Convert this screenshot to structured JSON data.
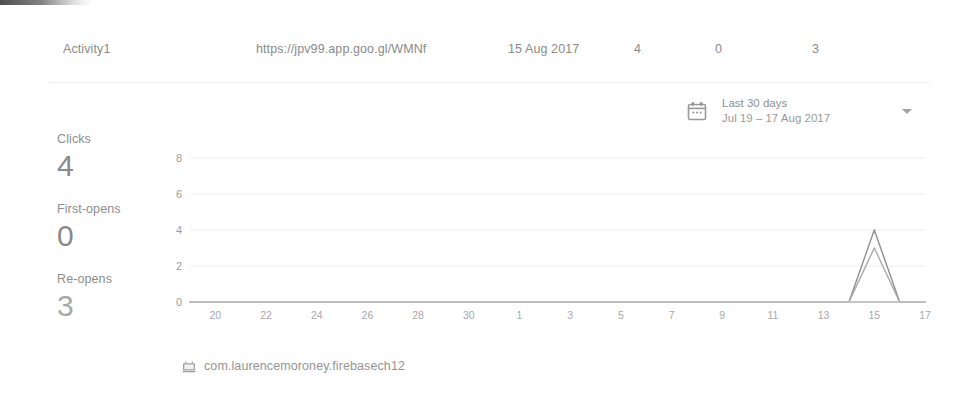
{
  "link_row": {
    "name": "Activity1",
    "url": "https://jpv99.app.goo.gl/WMNf",
    "date": "15 Aug 2017",
    "clicks": "4",
    "first_opens": "0",
    "re_opens": "3"
  },
  "date_range": {
    "icon": "calendar-icon",
    "preset": "Last 30 days",
    "range": "Jul 19 – 17 Aug 2017",
    "chevron": "chevron-down-icon"
  },
  "metrics": [
    {
      "label": "Clicks",
      "value": "4"
    },
    {
      "label": "First-opens",
      "value": "0"
    },
    {
      "label": "Re-opens",
      "value": "3"
    }
  ],
  "footer": {
    "icon": "android-app-icon",
    "app_id": "com.laurencemoroney.firebasech12"
  },
  "colors": {
    "text": "#8d8d8d",
    "grid": "#ededed",
    "axis": "#b8b8b8",
    "series_clicks": "#8f8f8f",
    "series_reopens": "#a9a9a9"
  },
  "chart_data": {
    "type": "line",
    "title": "",
    "xlabel": "",
    "ylabel": "",
    "grid": true,
    "legend": "none",
    "ylim": [
      0,
      8
    ],
    "yticks": [
      0,
      2,
      4,
      6,
      8
    ],
    "x": [
      "19",
      "20",
      "21",
      "22",
      "23",
      "24",
      "25",
      "26",
      "27",
      "28",
      "29",
      "30",
      "31",
      "1",
      "2",
      "3",
      "4",
      "5",
      "6",
      "7",
      "8",
      "9",
      "10",
      "11",
      "12",
      "13",
      "14",
      "15",
      "16",
      "17"
    ],
    "xticks": [
      "20",
      "22",
      "24",
      "26",
      "28",
      "30",
      "1",
      "3",
      "5",
      "7",
      "9",
      "11",
      "13",
      "15",
      "17"
    ],
    "series": [
      {
        "name": "Clicks",
        "color": "#8f8f8f",
        "values": [
          0,
          0,
          0,
          0,
          0,
          0,
          0,
          0,
          0,
          0,
          0,
          0,
          0,
          0,
          0,
          0,
          0,
          0,
          0,
          0,
          0,
          0,
          0,
          0,
          0,
          0,
          0,
          4,
          0,
          0
        ]
      },
      {
        "name": "Re-opens",
        "color": "#a9a9a9",
        "values": [
          0,
          0,
          0,
          0,
          0,
          0,
          0,
          0,
          0,
          0,
          0,
          0,
          0,
          0,
          0,
          0,
          0,
          0,
          0,
          0,
          0,
          0,
          0,
          0,
          0,
          0,
          0,
          3,
          0,
          0
        ]
      },
      {
        "name": "First-opens",
        "color": "#c4c4c4",
        "values": [
          0,
          0,
          0,
          0,
          0,
          0,
          0,
          0,
          0,
          0,
          0,
          0,
          0,
          0,
          0,
          0,
          0,
          0,
          0,
          0,
          0,
          0,
          0,
          0,
          0,
          0,
          0,
          0,
          0,
          0
        ]
      }
    ]
  }
}
